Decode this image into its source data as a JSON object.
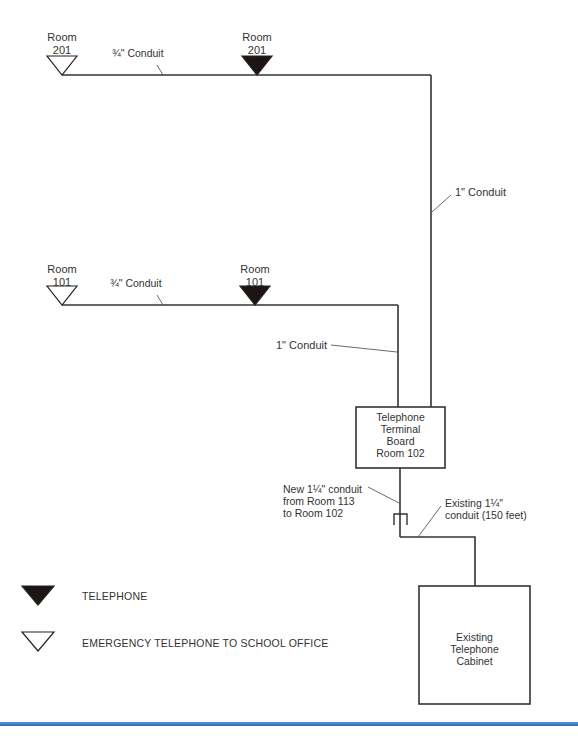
{
  "diagram": {
    "floor2": {
      "emergency_label": "Room\n201",
      "telephone_label": "Room\n201",
      "branch_conduit": "¾\" Conduit",
      "riser_conduit": "1\" Conduit"
    },
    "floor1": {
      "emergency_label": "Room\n101",
      "telephone_label": "Room\n101",
      "branch_conduit": "¾\" Conduit",
      "riser_conduit": "1\" Conduit"
    },
    "terminal_board": {
      "label": "Telephone\nTerminal\nBoard\nRoom 102"
    },
    "new_conduit_note": "New 1¼\" conduit\nfrom Room 113\nto Room 102",
    "existing_conduit_note": "Existing 1¼\"\nconduit (150 feet)",
    "cabinet": {
      "label": "Existing\nTelephone\nCabinet"
    },
    "legend": [
      {
        "symbol": "filled-triangle",
        "label": "TELEPHONE"
      },
      {
        "symbol": "open-triangle",
        "label": "EMERGENCY TELEPHONE TO SCHOOL OFFICE"
      }
    ],
    "colors": {
      "line": "#333333",
      "rule": "#3a7bc8"
    }
  }
}
